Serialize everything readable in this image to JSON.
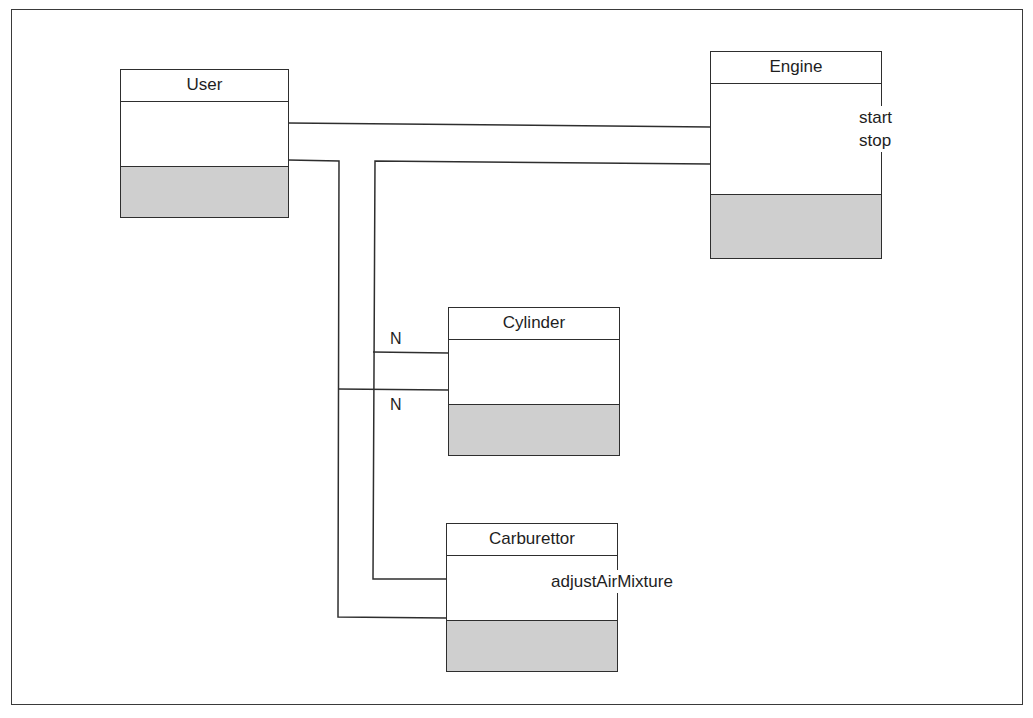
{
  "diagram": {
    "type": "UML class diagram",
    "classes": [
      {
        "id": "user",
        "name": "User",
        "operations": []
      },
      {
        "id": "engine",
        "name": "Engine",
        "operations": [
          "start",
          "stop"
        ]
      },
      {
        "id": "cylinder",
        "name": "Cylinder",
        "operations": []
      },
      {
        "id": "carburettor",
        "name": "Carburettor",
        "operations": [
          "adjustAirMixture"
        ]
      }
    ],
    "associations": [
      {
        "from": "User",
        "to": "Engine",
        "multiplicity": ""
      },
      {
        "from": "User",
        "to": "Cylinder",
        "multiplicity": "N"
      },
      {
        "from": "User",
        "to": "Carburettor",
        "multiplicity": ""
      },
      {
        "from": "Engine",
        "to": "Cylinder",
        "multiplicity": "N"
      },
      {
        "from": "Engine",
        "to": "Carburettor",
        "multiplicity": ""
      }
    ],
    "labels": {
      "user": "User",
      "engine": "Engine",
      "engine_op1": "start",
      "engine_op2": "stop",
      "cylinder": "Cylinder",
      "carburettor": "Carburettor",
      "carburettor_op1": "adjustAirMixture",
      "mult_engine_cylinder": "N",
      "mult_user_cylinder": "N"
    },
    "colors": {
      "line": "#2e2e2e",
      "compartment_fill": "#cfcfcf"
    }
  }
}
